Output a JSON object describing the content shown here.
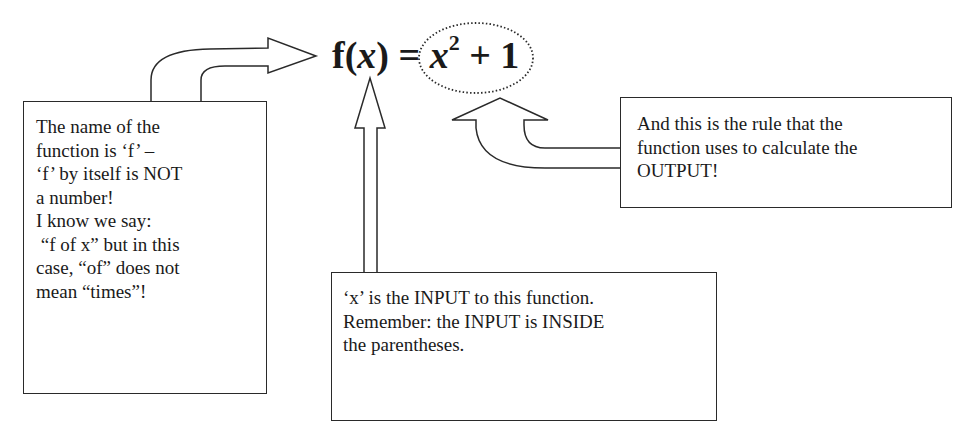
{
  "formula": {
    "function_name": "f",
    "open_paren": "(",
    "variable": "x",
    "close_paren": ")",
    "equals": " = ",
    "rule_base": "x",
    "rule_exponent": "2",
    "rule_tail": " + 1"
  },
  "callouts": {
    "name": {
      "lines": [
        "The name of the",
        "function is ‘f’ –",
        "‘f’ by itself is NOT",
        "a number!",
        "I know we say:",
        " “f of x” but in this",
        "case, “of” does not",
        "mean “times”!"
      ]
    },
    "input": {
      "lines": [
        "‘x’ is the INPUT to this function.",
        "Remember: the INPUT is INSIDE",
        "the parentheses."
      ]
    },
    "rule": {
      "lines": [
        "And this is the rule that the",
        "function uses to calculate the",
        "OUTPUT!"
      ]
    }
  },
  "colors": {
    "stroke": "#2a2a2a",
    "background": "#ffffff",
    "text": "#1a1a1a"
  }
}
